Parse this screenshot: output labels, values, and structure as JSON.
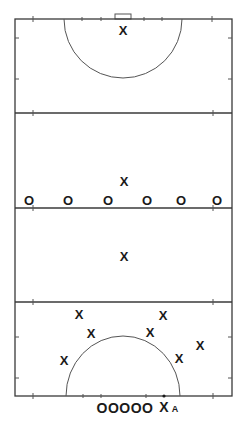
{
  "diagram": {
    "type": "field-hockey-pitch",
    "colors": {
      "lines": "#3a3a3a",
      "markers": "#1a1a1a",
      "background": "#ffffff"
    },
    "field": {
      "left": 15,
      "right": 232,
      "top": 19,
      "bottom": 396
    },
    "lines_y": [
      113,
      208,
      302
    ],
    "top_team_x": [
      {
        "label": "X",
        "x": 123,
        "y": 30
      },
      {
        "label": "X",
        "x": 124,
        "y": 181
      },
      {
        "label": "X",
        "x": 124,
        "y": 256
      }
    ],
    "o_line": [
      {
        "label": "O",
        "x": 29,
        "y": 200
      },
      {
        "label": "O",
        "x": 68,
        "y": 200
      },
      {
        "label": "O",
        "x": 108,
        "y": 200
      },
      {
        "label": "O",
        "x": 147,
        "y": 200
      },
      {
        "label": "O",
        "x": 181,
        "y": 200
      },
      {
        "label": "O",
        "x": 217,
        "y": 200
      }
    ],
    "circle_x": [
      {
        "label": "X",
        "x": 79,
        "y": 314
      },
      {
        "label": "X",
        "x": 91,
        "y": 333
      },
      {
        "label": "X",
        "x": 64,
        "y": 360
      },
      {
        "label": "X",
        "x": 163,
        "y": 315
      },
      {
        "label": "X",
        "x": 150,
        "y": 332
      },
      {
        "label": "X",
        "x": 200,
        "y": 345
      },
      {
        "label": "X",
        "x": 179,
        "y": 358
      }
    ],
    "goal_defenders": {
      "label": "OOOOO",
      "x": 125,
      "y": 408
    },
    "attacker": {
      "label": "X",
      "x": 164,
      "y": 407
    },
    "attacker_tag": {
      "label": "A",
      "x": 175,
      "y": 409
    }
  }
}
